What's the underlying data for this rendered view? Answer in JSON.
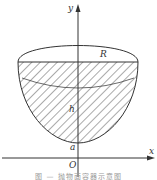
{
  "figure": {
    "labels": {
      "y_axis": "y",
      "x_axis": "x",
      "radius": "R",
      "depth": "h",
      "intercept": "a",
      "origin": "O"
    },
    "caption": "图 — 抛物面容器示意图",
    "colors": {
      "stroke": "#333333",
      "hatch": "#555555",
      "background": "#ffffff"
    }
  }
}
